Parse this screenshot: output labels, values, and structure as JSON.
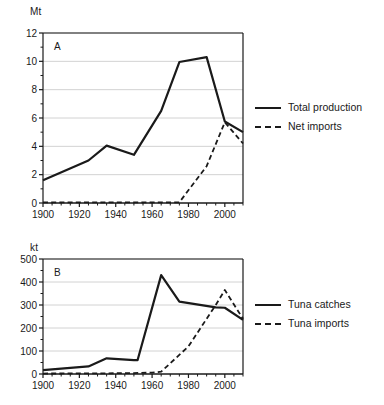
{
  "figure": {
    "background": "#ffffff",
    "line_color": "#1a1a1a",
    "grid_color": "#d2d2d2",
    "axis_color": "#1a1a1a"
  },
  "panel_a": {
    "tag": "A",
    "unit": "Mt",
    "legend": [
      {
        "label": "Total production",
        "style": "solid"
      },
      {
        "label": "Net imports",
        "style": "dashed"
      }
    ]
  },
  "panel_b": {
    "tag": "B",
    "unit": "kt",
    "legend": [
      {
        "label": "Tuna catches",
        "style": "solid"
      },
      {
        "label": "Tuna imports",
        "style": "dashed"
      }
    ]
  },
  "chart_data": [
    {
      "type": "line",
      "title": "A",
      "xlabel": "",
      "ylabel": "Mt",
      "xlim": [
        1900,
        2010
      ],
      "ylim": [
        0,
        12
      ],
      "yticks": [
        0,
        2,
        4,
        6,
        8,
        10,
        12
      ],
      "xticks": [
        1900,
        1920,
        1940,
        1960,
        1980,
        2000
      ],
      "xminor_step": 5,
      "yminor_step": 1,
      "grid": "horizontal-major",
      "legend_position": "right",
      "series": [
        {
          "name": "Total production",
          "style": "solid",
          "x": [
            1900,
            1925,
            1935,
            1950,
            1965,
            1975,
            1990,
            2000,
            2010
          ],
          "values": [
            1.6,
            3.0,
            4.05,
            3.4,
            6.5,
            9.95,
            10.3,
            5.75,
            5.0
          ]
        },
        {
          "name": "Net imports",
          "style": "dashed",
          "x": [
            1900,
            1925,
            1950,
            1965,
            1975,
            1990,
            2000,
            2010
          ],
          "values": [
            0.05,
            0.05,
            0.05,
            0.05,
            0.05,
            2.6,
            5.7,
            4.2
          ]
        }
      ]
    },
    {
      "type": "line",
      "title": "B",
      "xlabel": "",
      "ylabel": "kt",
      "xlim": [
        1900,
        2010
      ],
      "ylim": [
        0,
        500
      ],
      "yticks": [
        0,
        100,
        200,
        300,
        400,
        500
      ],
      "xticks": [
        1900,
        1920,
        1940,
        1960,
        1980,
        2000
      ],
      "xminor_step": 5,
      "yminor_step": 50,
      "grid": "horizontal-major",
      "legend_position": "right",
      "series": [
        {
          "name": "Tuna catches",
          "style": "solid",
          "x": [
            1900,
            1925,
            1935,
            1950,
            1952,
            1965,
            1975,
            1995,
            2000,
            2010
          ],
          "values": [
            17,
            33,
            68,
            60,
            60,
            430,
            315,
            290,
            288,
            235
          ]
        },
        {
          "name": "Tuna imports",
          "style": "dashed",
          "x": [
            1900,
            1935,
            1950,
            1960,
            1965,
            1980,
            1995,
            2000,
            2010
          ],
          "values": [
            2,
            3,
            4,
            6,
            10,
            120,
            300,
            365,
            240
          ]
        }
      ]
    }
  ]
}
